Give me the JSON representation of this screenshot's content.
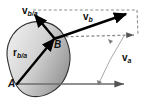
{
  "figure": {
    "background_color": "#ffffff",
    "body": {
      "name": "rigid-body-blob",
      "fill_light": "#e8e8e8",
      "fill_dark": "#9a9a9a",
      "stroke": "#2b2b2b"
    },
    "points": [
      {
        "id": "A",
        "label": "A",
        "x": 17,
        "y": 84
      },
      {
        "id": "B",
        "label": "B",
        "x": 54,
        "y": 39
      }
    ],
    "vectors": [
      {
        "id": "v_b_over_a",
        "label_base": "v",
        "label_sub": "b/a",
        "style": "solid-thick",
        "color": "#000000",
        "from": [
          54,
          39
        ],
        "to": [
          33,
          14
        ]
      },
      {
        "id": "v_b",
        "label_base": "v",
        "label_sub": "b",
        "style": "solid-thick",
        "color": "#000000",
        "from": [
          54,
          39
        ],
        "to": [
          128,
          13
        ]
      },
      {
        "id": "v_a",
        "label_base": "v",
        "label_sub": "a",
        "style": "solid-thin",
        "color": "#7a7a7a",
        "from": [
          17,
          84
        ],
        "to": [
          125,
          84
        ]
      },
      {
        "id": "r_b_over_a",
        "label_base": "r",
        "label_sub": "b/a",
        "style": "solid-thick",
        "color": "#000000",
        "from": [
          17,
          84
        ],
        "to": [
          54,
          39
        ]
      }
    ],
    "construction_lines": [
      {
        "id": "dashed-top",
        "style": "dashed",
        "color": "#8d8d8d",
        "from": [
          33,
          10
        ],
        "to": [
          138,
          10
        ]
      },
      {
        "id": "dashed-horizontal-through-B",
        "style": "dashed-arrow",
        "color": "#8d8d8d",
        "from": [
          54,
          39
        ],
        "to": [
          138,
          36
        ]
      },
      {
        "id": "dashed-right-closing",
        "style": "dashed",
        "color": "#8d8d8d",
        "from": [
          138,
          10
        ],
        "to": [
          138,
          36
        ]
      },
      {
        "id": "thin-va-upper-leg",
        "style": "solid-thin",
        "color": "#9a9a9a",
        "from": [
          122,
          36
        ],
        "to": [
          110,
          60
        ]
      },
      {
        "id": "thin-va-lower-leg",
        "style": "solid-thin",
        "color": "#9a9a9a",
        "from": [
          110,
          60
        ],
        "to": [
          98,
          84
        ]
      }
    ],
    "labels": [
      {
        "id": "label-vba",
        "base": "v",
        "sub": "b/a"
      },
      {
        "id": "label-vb",
        "base": "v",
        "sub": "b"
      },
      {
        "id": "label-va",
        "base": "v",
        "sub": "a"
      },
      {
        "id": "label-rba",
        "base": "r",
        "sub": "b/a"
      },
      {
        "id": "label-A",
        "text": "A"
      },
      {
        "id": "label-B",
        "text": "B"
      }
    ]
  }
}
